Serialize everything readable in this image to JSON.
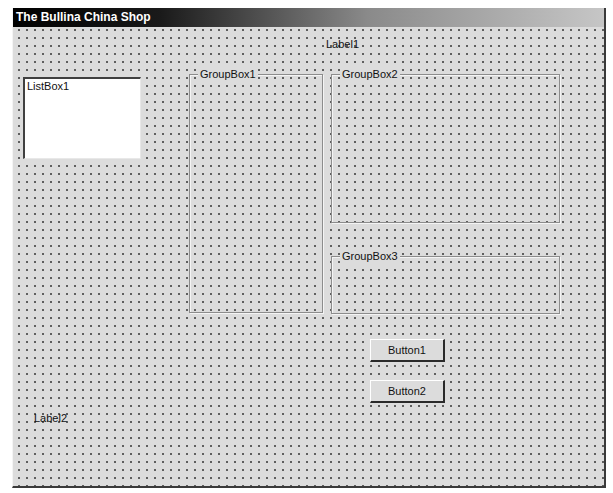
{
  "window": {
    "title": "The Bullina China Shop"
  },
  "labels": {
    "label1": "Label1",
    "label2": "Label2"
  },
  "listbox": {
    "items": [
      "ListBox1"
    ]
  },
  "groupboxes": {
    "groupbox1": "GroupBox1",
    "groupbox2": "GroupBox2",
    "groupbox3": "GroupBox3"
  },
  "buttons": {
    "button1": "Button1",
    "button2": "Button2"
  },
  "colors": {
    "form_background": "#dcdcdc",
    "grid_dot": "#5a5a5a",
    "titlebar_start": "#000000",
    "titlebar_end": "#c6c6c6",
    "listbox_background": "#ffffff"
  }
}
